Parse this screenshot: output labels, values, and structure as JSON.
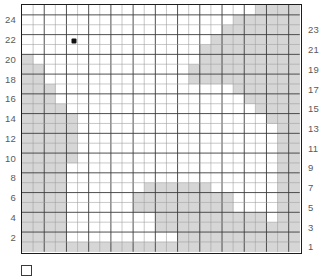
{
  "chart_data": {
    "type": "heatmap",
    "title": "",
    "subtitle": "",
    "xlabel": "",
    "ylabel": "",
    "grid": true,
    "legend_position": "bottom-left",
    "columns": 25,
    "rows": 25,
    "xlim": [
      1,
      25
    ],
    "ylim": [
      1,
      25
    ],
    "row_labels_left": [
      "24",
      "22",
      "20",
      "18",
      "16",
      "14",
      "12",
      "10",
      "8",
      "6",
      "4",
      "2"
    ],
    "row_labels_right": [
      "23",
      "21",
      "19",
      "17",
      "15",
      "13",
      "11",
      "9",
      "7",
      "5",
      "3",
      "1"
    ],
    "colors": {
      "filled": "#d6d6d6",
      "empty": "#ffffff",
      "gridline": "#3c3c3c",
      "gridline_minor": "#9a9a9a",
      "border": "#1d1d1d",
      "marker": "#111111",
      "label": "#5a5a5a"
    },
    "legend_entries": [
      {
        "swatch": "empty",
        "label": ""
      }
    ],
    "markers": [
      {
        "col": 5,
        "row": 22,
        "shape": "square-dot",
        "color": "#111111"
      }
    ],
    "note": "Each value is 1 = shaded cell, 0 = empty cell. Rows listed top (row 25) to bottom (row 1), each row has 25 column values left to right.",
    "cells": [
      [
        0,
        0,
        0,
        0,
        0,
        0,
        0,
        0,
        0,
        0,
        0,
        0,
        0,
        0,
        0,
        0,
        0,
        0,
        0,
        0,
        0,
        1,
        1,
        1,
        1
      ],
      [
        0,
        0,
        0,
        0,
        0,
        0,
        0,
        0,
        0,
        0,
        0,
        0,
        0,
        0,
        0,
        0,
        0,
        0,
        0,
        1,
        1,
        1,
        1,
        1,
        1
      ],
      [
        0,
        0,
        0,
        0,
        0,
        0,
        0,
        0,
        0,
        0,
        0,
        0,
        0,
        0,
        0,
        0,
        0,
        0,
        1,
        1,
        1,
        1,
        1,
        1,
        1
      ],
      [
        0,
        0,
        0,
        0,
        0,
        0,
        0,
        0,
        0,
        0,
        0,
        0,
        0,
        0,
        0,
        0,
        0,
        1,
        1,
        1,
        1,
        1,
        1,
        1,
        1
      ],
      [
        0,
        0,
        0,
        0,
        0,
        0,
        0,
        0,
        0,
        0,
        0,
        0,
        0,
        0,
        0,
        0,
        1,
        1,
        1,
        1,
        1,
        1,
        1,
        1,
        1
      ],
      [
        1,
        0,
        0,
        0,
        0,
        0,
        0,
        0,
        0,
        0,
        0,
        0,
        0,
        0,
        0,
        0,
        1,
        1,
        1,
        1,
        1,
        1,
        1,
        1,
        1
      ],
      [
        1,
        1,
        0,
        0,
        0,
        0,
        0,
        0,
        0,
        0,
        0,
        0,
        0,
        0,
        0,
        1,
        1,
        1,
        1,
        1,
        1,
        1,
        1,
        1,
        1
      ],
      [
        1,
        1,
        0,
        0,
        0,
        0,
        0,
        0,
        0,
        0,
        0,
        0,
        0,
        0,
        0,
        1,
        1,
        1,
        1,
        1,
        1,
        1,
        1,
        1,
        1
      ],
      [
        1,
        1,
        1,
        0,
        0,
        0,
        0,
        0,
        0,
        0,
        0,
        0,
        0,
        0,
        0,
        0,
        0,
        0,
        0,
        1,
        1,
        1,
        1,
        1,
        1
      ],
      [
        1,
        1,
        1,
        0,
        0,
        0,
        0,
        0,
        0,
        0,
        0,
        0,
        0,
        0,
        0,
        0,
        0,
        0,
        0,
        0,
        1,
        1,
        1,
        1,
        1
      ],
      [
        1,
        1,
        1,
        1,
        0,
        0,
        0,
        0,
        0,
        0,
        0,
        0,
        0,
        0,
        0,
        0,
        0,
        0,
        0,
        0,
        0,
        1,
        1,
        1,
        1
      ],
      [
        1,
        1,
        1,
        1,
        1,
        0,
        0,
        0,
        0,
        0,
        0,
        0,
        0,
        0,
        0,
        0,
        0,
        0,
        0,
        0,
        0,
        0,
        1,
        1,
        1
      ],
      [
        1,
        1,
        1,
        1,
        1,
        0,
        0,
        0,
        0,
        0,
        0,
        0,
        0,
        0,
        0,
        0,
        0,
        0,
        0,
        0,
        0,
        0,
        0,
        1,
        1
      ],
      [
        1,
        1,
        1,
        1,
        1,
        0,
        0,
        0,
        0,
        0,
        0,
        0,
        0,
        0,
        0,
        0,
        0,
        0,
        0,
        0,
        0,
        0,
        0,
        1,
        1
      ],
      [
        1,
        1,
        1,
        1,
        1,
        0,
        0,
        0,
        0,
        0,
        0,
        0,
        0,
        0,
        0,
        0,
        0,
        0,
        0,
        0,
        0,
        0,
        0,
        1,
        1
      ],
      [
        1,
        1,
        1,
        1,
        1,
        0,
        0,
        0,
        0,
        0,
        0,
        0,
        0,
        0,
        0,
        0,
        0,
        0,
        0,
        0,
        0,
        0,
        0,
        1,
        1
      ],
      [
        1,
        1,
        1,
        1,
        0,
        0,
        0,
        0,
        0,
        0,
        0,
        0,
        0,
        0,
        0,
        0,
        0,
        0,
        0,
        0,
        0,
        0,
        0,
        1,
        1
      ],
      [
        1,
        1,
        1,
        1,
        0,
        0,
        0,
        0,
        0,
        0,
        0,
        0,
        0,
        0,
        0,
        0,
        0,
        0,
        0,
        0,
        0,
        0,
        0,
        1,
        1
      ],
      [
        1,
        1,
        1,
        1,
        0,
        0,
        0,
        0,
        0,
        0,
        0,
        1,
        1,
        1,
        1,
        1,
        1,
        0,
        0,
        0,
        0,
        0,
        0,
        1,
        1
      ],
      [
        1,
        1,
        1,
        1,
        0,
        0,
        0,
        0,
        0,
        0,
        1,
        1,
        1,
        1,
        1,
        1,
        1,
        1,
        1,
        0,
        0,
        0,
        0,
        1,
        1
      ],
      [
        1,
        1,
        1,
        1,
        0,
        0,
        0,
        0,
        0,
        0,
        1,
        1,
        1,
        1,
        1,
        1,
        1,
        1,
        1,
        0,
        0,
        0,
        0,
        1,
        1
      ],
      [
        1,
        1,
        1,
        1,
        0,
        0,
        0,
        0,
        0,
        0,
        0,
        0,
        1,
        1,
        1,
        1,
        1,
        1,
        1,
        1,
        1,
        1,
        0,
        1,
        1
      ],
      [
        1,
        1,
        1,
        1,
        0,
        0,
        0,
        0,
        0,
        0,
        0,
        0,
        1,
        1,
        1,
        1,
        1,
        1,
        1,
        1,
        1,
        1,
        1,
        1,
        1
      ],
      [
        1,
        1,
        1,
        1,
        0,
        0,
        0,
        0,
        0,
        0,
        0,
        0,
        0,
        0,
        1,
        1,
        1,
        1,
        1,
        1,
        1,
        1,
        1,
        1,
        1
      ],
      [
        1,
        1,
        1,
        1,
        1,
        1,
        1,
        1,
        1,
        1,
        1,
        1,
        1,
        1,
        1,
        1,
        1,
        1,
        1,
        1,
        1,
        1,
        1,
        1,
        1
      ]
    ]
  },
  "legend": {
    "items": [
      {
        "label": ""
      }
    ]
  }
}
